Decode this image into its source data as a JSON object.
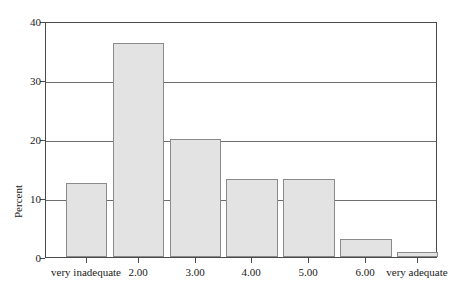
{
  "chart_data": {
    "type": "bar",
    "title": "",
    "xlabel": "",
    "ylabel": "Percent",
    "categories": [
      "very inadequate",
      "2.00",
      "3.00",
      "4.00",
      "5.00",
      "6.00",
      "very adequate"
    ],
    "values": [
      12.5,
      36.2,
      20.0,
      13.2,
      13.2,
      3.1,
      0.9
    ],
    "ylim": [
      0,
      40
    ],
    "yticks": [
      "0",
      "10",
      "20",
      "30",
      "40"
    ],
    "ytick_values": [
      0,
      10,
      20,
      30,
      40
    ],
    "grid": "horizontal",
    "legend": "none",
    "bar_fill": "#e3e3e3",
    "bar_border": "#8a8a8a",
    "axis_color": "#4a4a4a",
    "grid_color": "#6e6e6e",
    "background": "#ffffff"
  }
}
